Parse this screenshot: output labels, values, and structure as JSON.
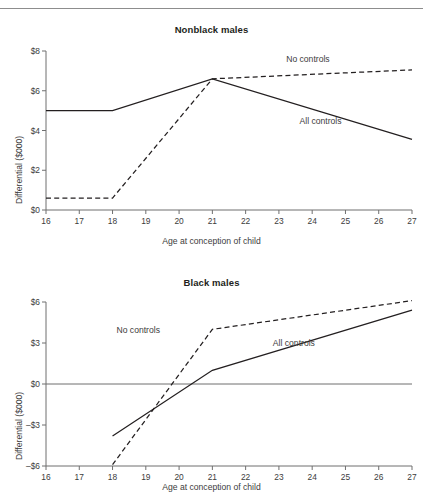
{
  "figure": {
    "has_top_rule": true,
    "line_color": "#231f20",
    "axis_color": "#6f6f6f",
    "text_color": "#3c3c3c"
  },
  "chart_data": [
    {
      "type": "line",
      "title": "Nonblack males",
      "xlabel": "Age at conception of child",
      "ylabel": "Differential ($000)",
      "xlim": [
        16,
        27
      ],
      "ylim": [
        0,
        8
      ],
      "xticks": [
        16,
        17,
        18,
        19,
        20,
        21,
        22,
        23,
        24,
        25,
        26,
        27
      ],
      "xticklabels": [
        "16",
        "17",
        "18",
        "19",
        "20",
        "21",
        "22",
        "23",
        "24",
        "25",
        "26",
        "27"
      ],
      "yticks": [
        0,
        2,
        4,
        6,
        8
      ],
      "yticklabels": [
        "$0",
        "$2",
        "$4",
        "$6",
        "$8"
      ],
      "grid": false,
      "legend_position": "inline-annotations",
      "series": [
        {
          "name": "No controls",
          "style": "dashed",
          "label_x": 24.0,
          "label_y": 7.55,
          "x": [
            16,
            17,
            18,
            21,
            27
          ],
          "values": [
            0.6,
            0.6,
            0.6,
            6.6,
            7.05
          ]
        },
        {
          "name": "All controls",
          "style": "solid",
          "label_x": 24.4,
          "label_y": 4.45,
          "x": [
            16,
            17,
            18,
            21,
            27
          ],
          "values": [
            5.0,
            5.0,
            5.0,
            6.6,
            3.55
          ]
        }
      ]
    },
    {
      "type": "line",
      "title": "Black males",
      "xlabel": "Age at conception of child",
      "ylabel": "Differential ($000)",
      "xlim": [
        16,
        27
      ],
      "ylim": [
        -6,
        6
      ],
      "xticks": [
        16,
        17,
        18,
        19,
        20,
        21,
        22,
        23,
        24,
        25,
        26,
        27
      ],
      "xticklabels": [
        "16",
        "17",
        "18",
        "19",
        "20",
        "21",
        "22",
        "23",
        "24",
        "25",
        "26",
        "27"
      ],
      "yticks": [
        -6,
        -3,
        0,
        3,
        6
      ],
      "yticklabels": [
        "–$6",
        "–$3",
        "$0",
        "$3",
        "$6"
      ],
      "grid": false,
      "zero_line": true,
      "legend_position": "inline-annotations",
      "series": [
        {
          "name": "No controls",
          "style": "dashed",
          "label_x": 18.9,
          "label_y": 3.85,
          "x": [
            18,
            21,
            27
          ],
          "values": [
            -5.9,
            4.0,
            6.1
          ]
        },
        {
          "name": "All controls",
          "style": "solid",
          "label_x": 23.6,
          "label_y": 2.95,
          "x": [
            18,
            21,
            27
          ],
          "values": [
            -3.8,
            1.0,
            5.4
          ]
        }
      ]
    }
  ]
}
